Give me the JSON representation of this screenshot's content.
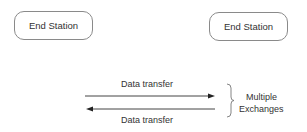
{
  "diagram": {
    "stations": [
      {
        "label": "End Station",
        "position": "left"
      },
      {
        "label": "End Station",
        "position": "right"
      }
    ],
    "arrows": [
      {
        "label": "Data transfer",
        "direction": "left-to-right"
      },
      {
        "label": "Data transfer",
        "direction": "right-to-left"
      }
    ],
    "brace_label": [
      "Multiple",
      "Exchanges"
    ],
    "colors": {
      "stroke": "#8a8a8a",
      "arrow": "#333333",
      "text": "#333333"
    }
  }
}
